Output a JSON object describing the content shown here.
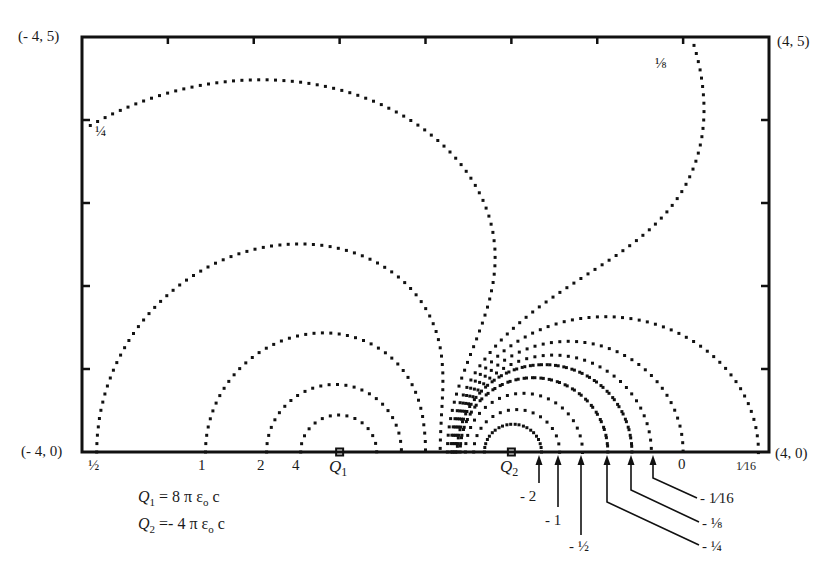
{
  "diagram": {
    "type": "equipotential-lines",
    "title": "",
    "frame": {
      "x_range": [
        -4,
        4
      ],
      "y_range": [
        0,
        5
      ],
      "corner_labels": {
        "top_left": "(- 4, 5)",
        "top_right": "(4, 5)",
        "bottom_left": "(- 4, 0)",
        "bottom_right": "(4, 0)"
      },
      "x_ticks": [
        -3,
        -2,
        -1,
        0,
        1,
        2,
        3
      ],
      "y_ticks": [
        1,
        2,
        3,
        4
      ]
    },
    "charges": [
      {
        "name": "Q1",
        "label": "Q",
        "sub": "1",
        "x": -1,
        "y": 0,
        "strength": 2
      },
      {
        "name": "Q2",
        "label": "Q",
        "sub": "2",
        "x": 1,
        "y": 0,
        "strength": -1
      }
    ],
    "formulas": [
      {
        "lhs": "Q",
        "sub": "1",
        "rhs": " = 8 π ε",
        "eps_sub": "o",
        "tail": " c"
      },
      {
        "lhs": "Q",
        "sub": "2",
        "rhs": " =- 4 π ε",
        "eps_sub": "o",
        "tail": " c"
      }
    ],
    "potential_formula": "V = 2c/r1 - c/r2",
    "contours": [
      {
        "value": 4,
        "label": "4"
      },
      {
        "value": 2,
        "label": "2"
      },
      {
        "value": 1,
        "label": "1"
      },
      {
        "value": 0.5,
        "label": "½"
      },
      {
        "value": 0.25,
        "label": "¼"
      },
      {
        "value": 0.125,
        "label": "⅛"
      },
      {
        "value": 0.0625,
        "label": "1⁄16"
      },
      {
        "value": 0,
        "label": "0"
      },
      {
        "value": -0.0625,
        "label": "- 1⁄16"
      },
      {
        "value": -0.125,
        "label": "- ⅛"
      },
      {
        "value": -0.25,
        "label": "- ¼"
      },
      {
        "value": -0.5,
        "label": "- ½"
      },
      {
        "value": -1,
        "label": "- 1"
      },
      {
        "value": -2,
        "label": "- 2"
      }
    ],
    "bottom_labels": [
      {
        "text": "½",
        "x": 88,
        "y": 458
      },
      {
        "text": "1",
        "x": 198,
        "y": 458
      },
      {
        "text": "2",
        "x": 257,
        "y": 458
      },
      {
        "text": "4",
        "x": 292,
        "y": 458
      },
      {
        "text": "0",
        "x": 678,
        "y": 457
      },
      {
        "text": "1⁄16",
        "x": 736,
        "y": 460
      }
    ],
    "inline_labels": [
      {
        "text": "¼",
        "x": 95,
        "y": 124
      },
      {
        "text": "⅛",
        "x": 655,
        "y": 56
      }
    ],
    "arrow_labels": [
      {
        "text": "- 2",
        "arrow_x": 539,
        "end": [
          539,
          483
        ],
        "label_x": 520,
        "label_y": 489
      },
      {
        "text": "- 1",
        "arrow_x": 558,
        "end": [
          558,
          507
        ],
        "label_x": 545,
        "label_y": 513
      },
      {
        "text": "- ½",
        "arrow_x": 581,
        "end": [
          581,
          535
        ],
        "label_x": 569,
        "label_y": 539
      },
      {
        "text": "- ¼",
        "arrow_x": 607,
        "bend_y": 502,
        "end": [
          699,
          545
        ],
        "label_x": 702,
        "label_y": 539
      },
      {
        "text": "- ⅛",
        "arrow_x": 631,
        "bend_y": 490,
        "end": [
          699,
          522
        ],
        "label_x": 702,
        "label_y": 516
      },
      {
        "text": "- 1⁄16",
        "arrow_x": 653,
        "bend_y": 478,
        "end": [
          697,
          498
        ],
        "label_x": 700,
        "label_y": 491
      }
    ],
    "colors": {
      "ink": "#111111",
      "background": "#ffffff"
    }
  },
  "chart_data": {
    "type": "contour",
    "xlabel": "",
    "ylabel": "",
    "xlim": [
      -4,
      4
    ],
    "ylim": [
      0,
      5
    ],
    "charges": [
      {
        "label": "Q1 = 8 π ε0 c",
        "x": -1,
        "y": 0
      },
      {
        "label": "Q2 = -4 π ε0 c",
        "x": 1,
        "y": 0
      }
    ],
    "levels": [
      4,
      2,
      1,
      0.5,
      0.25,
      0.125,
      0.0625,
      0,
      -0.0625,
      -0.125,
      -0.25,
      -0.5,
      -1,
      -2
    ],
    "grid": false
  }
}
